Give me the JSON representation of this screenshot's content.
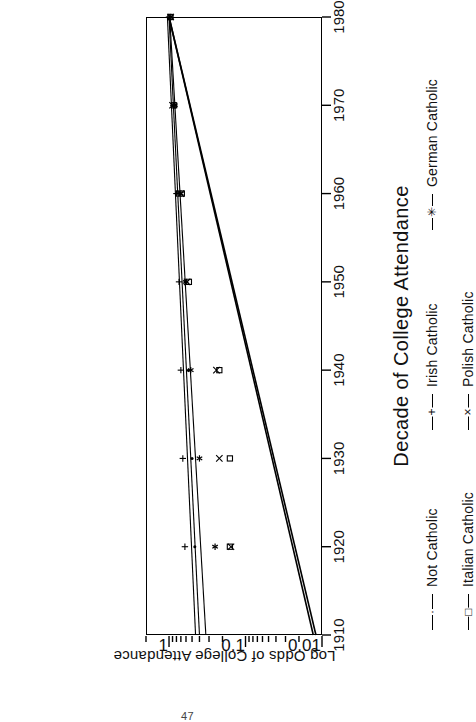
{
  "page": {
    "page_number": "47",
    "orientation": "rotated-90-ccw",
    "background_color": "#ffffff",
    "ink_color": "#000000"
  },
  "chart_data": {
    "type": "scatter",
    "title": "",
    "xlabel": "Decade of College Attendance",
    "ylabel": "Log Odds of College Attendance",
    "x": [
      1910,
      1920,
      1930,
      1940,
      1950,
      1960,
      1970,
      1980
    ],
    "xticks": [
      "1910",
      "1920",
      "1930",
      "1940",
      "1950",
      "1960",
      "1970",
      "1980"
    ],
    "xlim": [
      1910,
      1980
    ],
    "yscale": "log",
    "ylim": [
      0.01,
      2.0
    ],
    "yticks": [
      "1",
      "0.1",
      "0.01"
    ],
    "ytick_values": [
      1,
      0.1,
      0.01
    ],
    "grid": false,
    "legend_position": "below-axis",
    "series": [
      {
        "name": "Not Catholic",
        "marker": "dot",
        "marker_glyph": "·",
        "points": [
          {
            "x": 1920,
            "y": 0.46
          },
          {
            "x": 1930,
            "y": 0.5
          },
          {
            "x": 1940,
            "y": 0.56
          },
          {
            "x": 1950,
            "y": 0.62
          },
          {
            "x": 1960,
            "y": 0.72
          },
          {
            "x": 1970,
            "y": 0.82
          },
          {
            "x": 1980,
            "y": 0.95
          }
        ],
        "fit_line": {
          "y_1910": 0.4,
          "y_1980": 1.0
        }
      },
      {
        "name": "Irish Catholic",
        "marker": "plus",
        "marker_glyph": "+",
        "points": [
          {
            "x": 1920,
            "y": 0.62
          },
          {
            "x": 1930,
            "y": 0.66
          },
          {
            "x": 1940,
            "y": 0.7
          },
          {
            "x": 1950,
            "y": 0.74
          },
          {
            "x": 1960,
            "y": 0.8
          },
          {
            "x": 1970,
            "y": 0.88
          },
          {
            "x": 1980,
            "y": 1.0
          }
        ],
        "fit_line": {
          "y_1910": 0.45,
          "y_1980": 1.05
        }
      },
      {
        "name": "German Catholic",
        "marker": "asterisk",
        "marker_glyph": "✳",
        "points": [
          {
            "x": 1920,
            "y": 0.25
          },
          {
            "x": 1930,
            "y": 0.4
          },
          {
            "x": 1940,
            "y": 0.52
          },
          {
            "x": 1950,
            "y": 0.6
          },
          {
            "x": 1960,
            "y": 0.7
          },
          {
            "x": 1970,
            "y": 0.84
          },
          {
            "x": 1980,
            "y": 0.95
          }
        ],
        "fit_line": {
          "y_1910": 0.33,
          "y_1980": 0.98
        }
      },
      {
        "name": "Italian Catholic",
        "marker": "square",
        "marker_glyph": "□",
        "points": [
          {
            "x": 1920,
            "y": 0.16
          },
          {
            "x": 1930,
            "y": 0.16
          },
          {
            "x": 1940,
            "y": 0.22
          },
          {
            "x": 1950,
            "y": 0.55
          },
          {
            "x": 1960,
            "y": 0.68
          },
          {
            "x": 1970,
            "y": 0.86
          },
          {
            "x": 1980,
            "y": 0.96
          }
        ],
        "fit_line": {
          "y_1910": 0.012,
          "y_1980": 1.0
        }
      },
      {
        "name": "Polish Catholic",
        "marker": "cross",
        "marker_glyph": "×",
        "points": [
          {
            "x": 1920,
            "y": 0.155
          },
          {
            "x": 1930,
            "y": 0.22
          },
          {
            "x": 1940,
            "y": 0.24
          },
          {
            "x": 1950,
            "y": 0.58
          },
          {
            "x": 1960,
            "y": 0.7
          },
          {
            "x": 1970,
            "y": 0.9
          },
          {
            "x": 1980,
            "y": 0.95
          }
        ],
        "fit_line": {
          "y_1910": 0.013,
          "y_1980": 1.0
        }
      }
    ]
  },
  "axes": {
    "x_title": "Decade of College Attendance",
    "y_title": "Log Odds of College Attendance",
    "x_ticks": [
      {
        "label": "1910",
        "value": 1910
      },
      {
        "label": "1920",
        "value": 1920
      },
      {
        "label": "1930",
        "value": 1930
      },
      {
        "label": "1940",
        "value": 1940
      },
      {
        "label": "1950",
        "value": 1950
      },
      {
        "label": "1960",
        "value": 1960
      },
      {
        "label": "1970",
        "value": 1970
      },
      {
        "label": "1980",
        "value": 1980
      }
    ],
    "y_ticks": [
      {
        "label": "1",
        "value": 1
      },
      {
        "label": "0.1",
        "value": 0.1
      },
      {
        "label": "0.01",
        "value": 0.01
      }
    ]
  },
  "legend": {
    "entries": [
      {
        "label": "Not Catholic",
        "glyph": "·"
      },
      {
        "label": "Irish Catholic",
        "glyph": "+"
      },
      {
        "label": "German Catholic",
        "glyph": "✳"
      },
      {
        "label": "Italian Catholic",
        "glyph": "□"
      },
      {
        "label": "Polish Catholic",
        "glyph": "×"
      }
    ]
  }
}
